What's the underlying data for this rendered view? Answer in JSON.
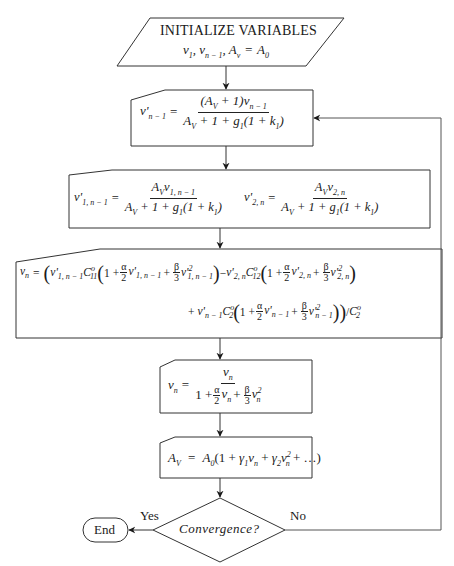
{
  "diagram": {
    "init": {
      "heading": "INITIALIZE VARIABLES",
      "vars": "v₁, vₙ₋₁, Aᵥ = A₀"
    },
    "step1": {
      "lhs": "v'ₙ₋₁",
      "numerator": "(A_V + 1)vₙ₋₁",
      "denominator": "A_V + 1 + g₁(1 + k₁)"
    },
    "step2": {
      "eq_a_lhs": "v'₁,ₙ₋₁",
      "eq_a_numerator": "A_V v₁,ₙ₋₁",
      "eq_a_denominator": "A_V + 1 + g₁(1 + k₁)",
      "eq_b_lhs": "v'₂,ₙ",
      "eq_b_numerator": "A_V v₂,ₙ",
      "eq_b_denominator": "A_V + 1 + g₁(1 + k₁)"
    },
    "step3": {
      "line1": "vₙ = (v'₁,ₙ₋₁ C°₁₁(1 + α/2 v'₁,ₙ₋₁ + β/3 v'²₁,ₙ₋₁) − v'₂,ₙ C°₁₂(1 + α/2 v'₂,ₙ + β/3 v'²₂,ₙ)",
      "line2": "+ v'ₙ₋₁ C°₂(1 + α/2 v'ₙ₋₁ + β/3 v'²ₙ₋₁)) / C°₂"
    },
    "step4": {
      "lhs": "vₙ",
      "numerator": "vₙ",
      "denominator": "1 + α/2 vₙ + β/3 vₙ²"
    },
    "step5": {
      "lhs": "A_V",
      "rhs": "A₀(1 + γ₁vₙ + γ₂vₙ² + …)"
    },
    "decision": {
      "label": "Convergence?",
      "yes_label": "Yes",
      "no_label": "No"
    },
    "terminal": {
      "label": "End"
    }
  },
  "symbols": {
    "equals": "=",
    "alpha": "α",
    "beta": "β",
    "two": "2",
    "three": "3",
    "one_plus": "1 +",
    "plus": "+",
    "minus": "−",
    "lparen": "(",
    "rparen": ")",
    "slash": "/"
  }
}
